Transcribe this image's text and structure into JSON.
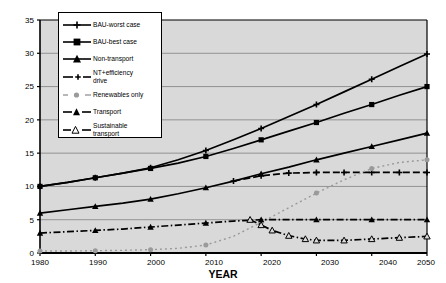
{
  "chart_data": {
    "type": "line",
    "title": "",
    "xlabel": "YEAR",
    "ylabel": "POWER in TW",
    "xlim": [
      1980,
      2050
    ],
    "ylim": [
      0,
      35
    ],
    "xticks": [
      "1980",
      "1990",
      "2000",
      "2010",
      "2020",
      "2030",
      "2040",
      "2050"
    ],
    "yticks": [
      "0",
      "5",
      "10",
      "15",
      "20",
      "25",
      "30",
      "35"
    ],
    "grid": "horizontal",
    "legend_position": "upper-left-inside",
    "plot_background": "#d9d9d9",
    "series": [
      {
        "name": "BAU-worst case",
        "marker": "plus-cross",
        "linestyle": "solid",
        "color": "#000000",
        "x": [
          1980,
          1985,
          1990,
          1995,
          2000,
          2005,
          2010,
          2015,
          2020,
          2025,
          2030,
          2035,
          2040,
          2045,
          2050
        ],
        "y": [
          10.0,
          10.6,
          11.3,
          12.0,
          12.8,
          14.0,
          15.4,
          17.0,
          18.7,
          20.5,
          22.3,
          24.2,
          26.1,
          28.0,
          29.9
        ]
      },
      {
        "name": "BAU-best case",
        "marker": "square-filled",
        "linestyle": "solid",
        "color": "#000000",
        "x": [
          1980,
          1985,
          1990,
          1995,
          2000,
          2005,
          2010,
          2015,
          2020,
          2025,
          2030,
          2035,
          2040,
          2045,
          2050
        ],
        "y": [
          10.0,
          10.6,
          11.3,
          12.0,
          12.7,
          13.5,
          14.5,
          15.7,
          17.0,
          18.3,
          19.6,
          21.0,
          22.3,
          23.7,
          25.0
        ]
      },
      {
        "name": "Non-transport",
        "marker": "triangle-filled",
        "linestyle": "solid",
        "color": "#000000",
        "x": [
          1980,
          1985,
          1990,
          1995,
          2000,
          2005,
          2010,
          2015,
          2020,
          2025,
          2030,
          2035,
          2040,
          2045,
          2050
        ],
        "y": [
          6.0,
          6.5,
          7.0,
          7.5,
          8.1,
          8.9,
          9.8,
          10.8,
          11.9,
          12.9,
          14.0,
          15.0,
          16.0,
          17.0,
          18.0
        ]
      },
      {
        "name": "NT+efficiency drive",
        "marker": "plus-cross",
        "linestyle": "dashed",
        "color": "#000000",
        "x": [
          2015,
          2020,
          2025,
          2030,
          2035,
          2040,
          2045,
          2050
        ],
        "y": [
          10.8,
          11.6,
          12.0,
          12.1,
          12.1,
          12.1,
          12.1,
          12.1
        ]
      },
      {
        "name": "Renewables only",
        "marker": "circle-grey",
        "linestyle": "dotted",
        "color": "#9a9a9a",
        "x": [
          1980,
          1985,
          1990,
          1995,
          2000,
          2005,
          2010,
          2015,
          2020,
          2025,
          2030,
          2035,
          2040,
          2045,
          2050
        ],
        "y": [
          0.3,
          0.3,
          0.35,
          0.4,
          0.5,
          0.7,
          1.2,
          2.5,
          4.6,
          6.8,
          9.0,
          11.0,
          12.7,
          13.6,
          14.0
        ]
      },
      {
        "name": "Transport",
        "marker": "triangle-filled",
        "linestyle": "dash-dot",
        "color": "#000000",
        "x": [
          1980,
          1985,
          1990,
          1995,
          2000,
          2005,
          2010,
          2015,
          2020,
          2025,
          2030,
          2035,
          2040,
          2045,
          2050
        ],
        "y": [
          3.0,
          3.2,
          3.4,
          3.6,
          3.9,
          4.2,
          4.5,
          4.8,
          5.0,
          5.0,
          5.0,
          5.0,
          5.0,
          5.0,
          5.0
        ]
      },
      {
        "name": "Sustainable transport",
        "marker": "triangle-open",
        "linestyle": "dash-dot",
        "color": "#000000",
        "x": [
          2018,
          2020,
          2022,
          2025,
          2028,
          2030,
          2035,
          2040,
          2045,
          2050
        ],
        "y": [
          5.0,
          4.2,
          3.4,
          2.6,
          2.1,
          1.9,
          1.9,
          2.1,
          2.3,
          2.5
        ]
      }
    ]
  },
  "legend": {
    "items": [
      {
        "label": "BAU-worst case"
      },
      {
        "label": "BAU-best case"
      },
      {
        "label": "Non-transport"
      },
      {
        "label": "NT+efficiency\ndrive"
      },
      {
        "label": "Renewables only"
      },
      {
        "label": "Transport"
      },
      {
        "label": "Sustainable\ntransport"
      }
    ]
  },
  "axes": {
    "ylabel": "POWER in TW",
    "xlabel": "YEAR"
  }
}
